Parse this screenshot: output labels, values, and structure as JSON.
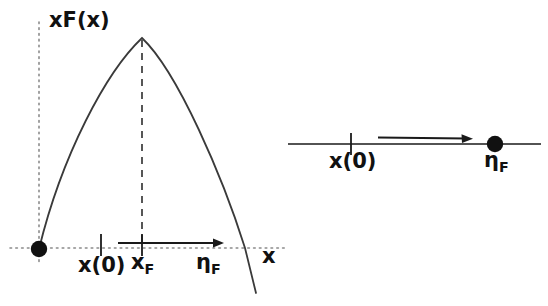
{
  "figure": {
    "type": "diagram",
    "ink_color": "#1a1a1a",
    "axis_color": "#6e6e6e",
    "background": "#ffffff"
  },
  "left_panel": {
    "name": "xF(x) parabola plot",
    "y_axis": {
      "label": "xF(x)",
      "style": "dotted",
      "x_px": 39,
      "y_from_px": 22,
      "y_to_px": 262
    },
    "x_axis": {
      "label": "x",
      "style": "dotted",
      "y_px": 248,
      "x_from_px": 10,
      "x_to_px": 286
    },
    "origin_marker": {
      "name": "filled-circle-at-origin",
      "x_px": 39,
      "y_px": 249,
      "radius_px": 8
    },
    "curve": {
      "name": "xF(x)",
      "shape": "parabola",
      "start_px": [
        39,
        249
      ],
      "peak_px": [
        142,
        38
      ],
      "zero_crossing_px": [
        245,
        248
      ],
      "end_px": [
        256,
        293
      ]
    },
    "peak_dashed_line": {
      "name": "dashed-line-to-peak",
      "x_px": 142,
      "y_from_px": 38,
      "y_to_px": 248
    },
    "ticks": [
      {
        "label": "x(0)",
        "x_px": 101,
        "y_px": 245,
        "half_height_px": 11
      },
      {
        "label": "xF",
        "x_px": 142,
        "y_px": 245,
        "half_height_px": 11
      }
    ],
    "arrow": {
      "name": "flow-arrow",
      "direction": "right",
      "x_from_px": 118,
      "x_to_px": 224,
      "y_px": 243,
      "label": "ηF"
    },
    "labels": {
      "y_axis_label": "xF(x)",
      "x_axis_label": "x",
      "x_initial": "x(0)",
      "x_F_base": "x",
      "x_F_sub": "F",
      "eta_F_base": "η",
      "eta_F_sub": "F"
    }
  },
  "right_panel": {
    "name": "one-dimensional flow line",
    "line": {
      "name": "number-line",
      "y_px": 144,
      "x_from_px": 288,
      "x_to_px": 541
    },
    "tick": {
      "label": "x(0)",
      "x_px": 351,
      "y_px": 144,
      "half_height_px": 11
    },
    "fixed_point": {
      "name": "filled-circle-fixed-point",
      "x_px": 495,
      "y_px": 144,
      "radius_px": 8,
      "label": "ηF"
    },
    "arrow": {
      "name": "flow-arrow",
      "direction": "right",
      "x_from_px": 378,
      "x_to_px": 472,
      "y_px": 137
    },
    "labels": {
      "x_initial": "x(0)",
      "eta_F_base": "η",
      "eta_F_sub": "F"
    }
  }
}
